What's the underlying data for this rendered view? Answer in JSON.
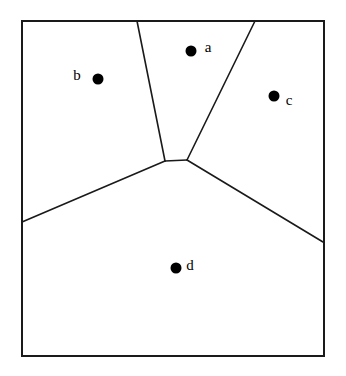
{
  "figure": {
    "type": "voronoi-diagram",
    "title": "",
    "background_color": "#ffffff",
    "line_color": "#1a1a1a",
    "point_color": "#000000",
    "text_color": "#000000"
  },
  "bounding_box": {
    "x0": 22,
    "y0": 21,
    "x1": 324,
    "y1": 356,
    "stroke_width": 2
  },
  "sites": [
    {
      "label": "a",
      "x": 191,
      "y": 51,
      "r": 5.5,
      "label_x": 208,
      "label_y": 49
    },
    {
      "label": "b",
      "x": 98,
      "y": 79,
      "r": 5.5,
      "label_x": 77,
      "label_y": 77
    },
    {
      "label": "c",
      "x": 274,
      "y": 96,
      "r": 5.5,
      "label_x": 289,
      "label_y": 102
    },
    {
      "label": "d",
      "x": 176,
      "y": 268,
      "r": 5.5,
      "label_x": 190,
      "label_y": 267
    }
  ],
  "vertices": [
    {
      "name": "v-left",
      "x": 165,
      "y": 161
    },
    {
      "name": "v-right",
      "x": 187,
      "y": 160
    }
  ],
  "edges": [
    {
      "name": "edge-ab",
      "x1": 165,
      "y1": 161,
      "x2": 137,
      "y2": 21,
      "from": "v-left",
      "to": "top-border"
    },
    {
      "name": "edge-ac",
      "x1": 187,
      "y1": 160,
      "x2": 255,
      "y2": 21,
      "from": "v-right",
      "to": "top-border"
    },
    {
      "name": "edge-ad",
      "x1": 165,
      "y1": 161,
      "x2": 187,
      "y2": 160,
      "from": "v-left",
      "to": "v-right"
    },
    {
      "name": "edge-bd",
      "x1": 165,
      "y1": 161,
      "x2": 22,
      "y2": 222,
      "from": "v-left",
      "to": "left-border"
    },
    {
      "name": "edge-cd",
      "x1": 187,
      "y1": 160,
      "x2": 323,
      "y2": 242,
      "from": "v-right",
      "to": "right-border"
    }
  ],
  "chart_data": {
    "type": "scatter",
    "title": "",
    "xlabel": "",
    "ylabel": "",
    "xlim": [
      22,
      324
    ],
    "ylim": [
      21,
      356
    ],
    "grid": false,
    "legend": "none",
    "annotations": [
      "a",
      "b",
      "c",
      "d"
    ],
    "categories": [
      "a",
      "b",
      "c",
      "d"
    ],
    "points": [
      {
        "label": "a",
        "x": 191,
        "y": 51
      },
      {
        "label": "b",
        "x": 98,
        "y": 79
      },
      {
        "label": "c",
        "x": 274,
        "y": 96
      },
      {
        "label": "d",
        "x": 176,
        "y": 268
      }
    ]
  }
}
